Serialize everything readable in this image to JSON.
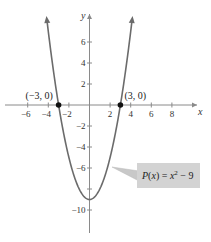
{
  "chart_data": {
    "type": "line",
    "title": "",
    "function": "P(x) = x^2 - 9",
    "xlabel": "x",
    "ylabel": "y",
    "xlim": [
      -8.5,
      9.5
    ],
    "ylim": [
      -12,
      8.5
    ],
    "x_ticks": [
      -6,
      -4,
      -2,
      2,
      4,
      6,
      8
    ],
    "x_tick_labels": [
      "−6",
      "−4",
      "−2",
      "2",
      "4",
      "6",
      "8"
    ],
    "y_ticks": [
      6,
      4,
      2,
      -2,
      -4,
      -6,
      -8,
      -10
    ],
    "y_tick_labels": [
      "6",
      "4",
      "2",
      "−2",
      "−4",
      "−6",
      "",
      "−10"
    ],
    "grid": false,
    "series": [
      {
        "name": "P(x) = x^2 - 9",
        "x": [
          -4.1,
          -4,
          -3,
          -2,
          -1,
          0,
          1,
          2,
          3,
          4,
          4.1
        ],
        "y": [
          7.81,
          7,
          0,
          -5,
          -8,
          -9,
          -8,
          -5,
          0,
          7,
          7.81
        ]
      }
    ],
    "points": [
      {
        "x": -3,
        "y": 0,
        "label": "(−3, 0)"
      },
      {
        "x": 3,
        "y": 0,
        "label": "(3, 0)"
      }
    ],
    "annotations": [
      {
        "text_main": "P(x) = x",
        "exponent": "2",
        "text_tail": " − 9",
        "box_color": "#d3d3d3"
      }
    ],
    "colors": {
      "curve": "#6b6b6b",
      "axis": "#8a8a8a",
      "point": "#111111",
      "label_box": "#d3d3d3"
    }
  }
}
